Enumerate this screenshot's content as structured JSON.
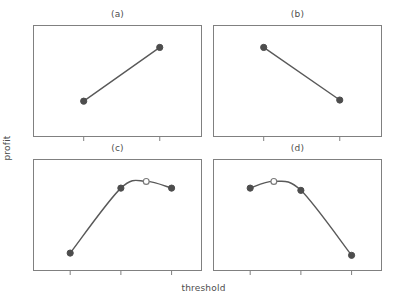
{
  "figure": {
    "xlabel": "threshold",
    "ylabel": "profit",
    "line_color": "#595959",
    "marker_fill_color": "#4d4d4d",
    "marker_hollow_fill": "#ffffff",
    "frame_color": "#808080",
    "background_color": "#ffffff"
  },
  "panels": [
    {
      "id": "a",
      "title": "(a)"
    },
    {
      "id": "b",
      "title": "(b)"
    },
    {
      "id": "c",
      "title": "(c)"
    },
    {
      "id": "d",
      "title": "(d)"
    }
  ],
  "chart_data": [
    {
      "type": "line",
      "title": "(a)",
      "xlabel": "threshold",
      "ylabel": "profit",
      "xlim": [
        0,
        1
      ],
      "ylim": [
        0,
        1
      ],
      "grid": false,
      "legend": null,
      "xticks": [
        0.3,
        0.75
      ],
      "xticklabels": [
        "",
        ""
      ],
      "yticklabels": [],
      "description": "Monotonically increasing profit with threshold; two observed points joined by a straight line.",
      "series": [
        {
          "name": "profit",
          "marker": "filled-circle",
          "x": [
            0.3,
            0.75
          ],
          "y": [
            0.32,
            0.8
          ]
        }
      ]
    },
    {
      "type": "line",
      "title": "(b)",
      "xlabel": "threshold",
      "ylabel": "profit",
      "xlim": [
        0,
        1
      ],
      "ylim": [
        0,
        1
      ],
      "grid": false,
      "legend": null,
      "xticks": [
        0.3,
        0.75
      ],
      "xticklabels": [
        "",
        ""
      ],
      "yticklabels": [],
      "description": "Monotonically decreasing profit with threshold; two observed points joined by a straight line.",
      "series": [
        {
          "name": "profit",
          "marker": "filled-circle",
          "x": [
            0.3,
            0.75
          ],
          "y": [
            0.8,
            0.33
          ]
        }
      ]
    },
    {
      "type": "line",
      "title": "(c)",
      "xlabel": "threshold",
      "ylabel": "profit",
      "xlim": [
        0,
        1
      ],
      "ylim": [
        0,
        1
      ],
      "grid": false,
      "legend": null,
      "xticks": [
        0.22,
        0.52,
        0.82
      ],
      "xticklabels": [
        "",
        "",
        ""
      ],
      "yticklabels": [],
      "description": "Concave profit curve rising steeply then flattening; optimum lies between the second and third observed thresholds and is marked with a hollow circle.",
      "series": [
        {
          "name": "profit",
          "marker": "filled-circle",
          "x": [
            0.22,
            0.52,
            0.82
          ],
          "y": [
            0.16,
            0.74,
            0.74
          ]
        },
        {
          "name": "optimum",
          "marker": "hollow-circle",
          "x": [
            0.67
          ],
          "y": [
            0.8
          ]
        }
      ]
    },
    {
      "type": "line",
      "title": "(d)",
      "xlabel": "threshold",
      "ylabel": "profit",
      "xlim": [
        0,
        1
      ],
      "ylim": [
        0,
        1
      ],
      "grid": false,
      "legend": null,
      "xticks": [
        0.22,
        0.52,
        0.82
      ],
      "xticklabels": [
        "",
        "",
        ""
      ],
      "yticklabels": [],
      "description": "Concave profit curve peaking early then falling steeply; optimum lies between the first and second observed thresholds and is marked with a hollow circle.",
      "series": [
        {
          "name": "profit",
          "marker": "filled-circle",
          "x": [
            0.22,
            0.52,
            0.82
          ],
          "y": [
            0.74,
            0.72,
            0.14
          ]
        },
        {
          "name": "optimum",
          "marker": "hollow-circle",
          "x": [
            0.36
          ],
          "y": [
            0.8
          ]
        }
      ]
    }
  ]
}
